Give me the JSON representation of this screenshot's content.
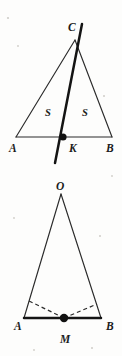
{
  "document": {
    "kind": "geometry-figure-sheet",
    "figure_count": 2
  },
  "figures": [
    {
      "id": "figure-triangle-abc",
      "title": "Triangle ABC with line through C and K",
      "vertices": [
        {
          "name": "A",
          "label": "A",
          "x": 16,
          "y": 137
        },
        {
          "name": "B",
          "label": "B",
          "x": 112,
          "y": 137
        },
        {
          "name": "C",
          "label": "C",
          "x": 75,
          "y": 40
        },
        {
          "name": "K",
          "label": "K",
          "x": 63,
          "y": 137
        }
      ],
      "labels": {
        "A": "A",
        "B": "B",
        "C": "C",
        "K": "K",
        "area_left": "S",
        "area_right": "S"
      },
      "label_positions": {
        "A": {
          "x": 9,
          "y": 152
        },
        "B": {
          "x": 106,
          "y": 152
        },
        "C": {
          "x": 68,
          "y": 31
        },
        "K": {
          "x": 69,
          "y": 152
        },
        "area_left": {
          "x": 45,
          "y": 116
        },
        "area_right": {
          "x": 82,
          "y": 116
        }
      },
      "segments": [
        {
          "name": "side-AB",
          "from": "A",
          "to": "B",
          "style": "thin"
        },
        {
          "name": "side-AC",
          "from": "A",
          "to": "C",
          "style": "thin"
        },
        {
          "name": "side-BC",
          "from": "B",
          "to": "C",
          "style": "thin"
        }
      ],
      "transversal": {
        "name": "line-through-C-and-K",
        "style": "thick",
        "x1": 82,
        "y1": 24,
        "x2": 55,
        "y2": 163
      },
      "marked_points": [
        {
          "name": "K",
          "x": 63,
          "y": 137,
          "r": 3.6
        }
      ]
    },
    {
      "id": "figure-triangle-oab",
      "title": "Triangle OAB with dashed segments to midpoint M",
      "vertices": [
        {
          "name": "O",
          "label": "O",
          "x": 61,
          "y": 194
        },
        {
          "name": "A",
          "label": "A",
          "x": 24,
          "y": 318
        },
        {
          "name": "B",
          "label": "B",
          "x": 101,
          "y": 318
        },
        {
          "name": "M",
          "label": "M",
          "x": 64,
          "y": 318
        }
      ],
      "labels": {
        "O": "O",
        "A": "A",
        "B": "B",
        "M": "M"
      },
      "label_positions": {
        "O": {
          "x": 56,
          "y": 190
        },
        "A": {
          "x": 14,
          "y": 330
        },
        "B": {
          "x": 106,
          "y": 330
        },
        "M": {
          "x": 60,
          "y": 343
        }
      },
      "segments": [
        {
          "name": "side-OA",
          "from": "O",
          "to": "A",
          "style": "thin"
        },
        {
          "name": "side-OB",
          "from": "O",
          "to": "B",
          "style": "thin"
        },
        {
          "name": "base-AB",
          "from": "A",
          "to": "B",
          "style": "thick"
        }
      ],
      "dashed_segments": [
        {
          "name": "dashed-P-to-M",
          "x1": 29,
          "y1": 301,
          "x2": 64,
          "y2": 318
        },
        {
          "name": "dashed-M-to-Q",
          "x1": 64,
          "y1": 318,
          "x2": 97,
          "y2": 304
        }
      ],
      "marked_points": [
        {
          "name": "M",
          "x": 64,
          "y": 318,
          "r": 4.2
        }
      ]
    }
  ]
}
